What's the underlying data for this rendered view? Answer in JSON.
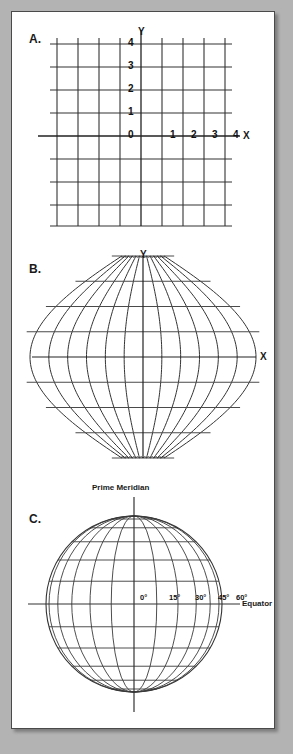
{
  "page": {
    "background_color": "#b3b3b3",
    "paper_color": "#ffffff",
    "border_color": "#4a4a4a",
    "line_color": "#333333"
  },
  "panels": [
    {
      "id": "A",
      "letter": "A.",
      "name": "cartesian-grid",
      "axis_labels": {
        "x": "X",
        "y": "Y"
      },
      "x_ticks": [
        "1",
        "2",
        "3",
        "4"
      ],
      "y_ticks": [
        "1",
        "2",
        "3",
        "4"
      ],
      "origin_label": "0",
      "grid_columns": 8,
      "grid_rows": 8
    },
    {
      "id": "B",
      "letter": "B.",
      "name": "sinusoidal-projection",
      "axis_labels": {
        "x": "X",
        "y": "Y"
      },
      "meridian_count": 13,
      "parallel_count": 9
    },
    {
      "id": "C",
      "letter": "C.",
      "name": "globe-graticule",
      "prime_meridian_label": "Prime Meridian",
      "equator_label": "Equator",
      "longitude_labels": [
        "0°",
        "15°",
        "30°",
        "45°",
        "60°"
      ],
      "meridian_interval_degrees": 15,
      "parallel_interval_degrees": 15
    }
  ],
  "chart_data": {
    "type": "diagram",
    "subfigures": [
      {
        "label": "A.",
        "description": "Plane rectangular Cartesian coordinate grid, 8 by 8 cells, axes X and Y through the centre.",
        "x_axis": {
          "label": "X",
          "ticks": [
            0,
            1,
            2,
            3,
            4
          ]
        },
        "y_axis": {
          "label": "Y",
          "ticks": [
            0,
            1,
            2,
            3,
            4
          ]
        }
      },
      {
        "label": "B.",
        "description": "Sinusoidal (equal-area) projection graticule with straight horizontal parallels and converging curved meridians forming a hexagonal outline.",
        "x_axis": {
          "label": "X"
        },
        "y_axis": {
          "label": "Y"
        },
        "meridians": 13,
        "parallels": 9
      },
      {
        "label": "C.",
        "description": "Globe shown as a circle with a graticule of meridians and parallels spaced 15 degrees apart.",
        "annotations": [
          "Prime Meridian",
          "Equator"
        ],
        "longitude_ticks": [
          0,
          15,
          30,
          45,
          60
        ],
        "meridian_spacing_deg": 15,
        "parallel_spacing_deg": 15
      }
    ]
  }
}
